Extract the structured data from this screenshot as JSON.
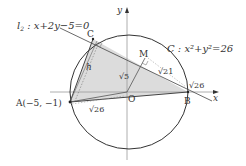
{
  "diagram": {
    "line_label": {
      "name": "l",
      "subscript": "2",
      "equation": "x+2y−5=0"
    },
    "circle_label": {
      "name": "C",
      "equation": "x²+y²=26"
    },
    "axes": {
      "x": "x",
      "y": "y"
    },
    "points": {
      "A": "A(−5, −1)",
      "B": "B",
      "C": "C",
      "M": "M",
      "O": "O"
    },
    "segment_labels": {
      "h": "h",
      "OM": "√5",
      "MB": "√21",
      "OB": "√26",
      "OA": "√26"
    },
    "colors": {
      "fill": "#d9d9d9",
      "stroke": "#333333",
      "axis": "#999999",
      "circle": "#333333"
    }
  }
}
